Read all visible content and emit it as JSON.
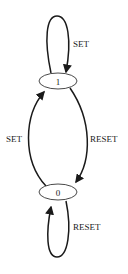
{
  "diagram": {
    "type": "state-diagram",
    "nodes": [
      {
        "id": "1",
        "label": "1"
      },
      {
        "id": "0",
        "label": "0"
      }
    ],
    "edges": [
      {
        "from": "1",
        "to": "1",
        "label": "SET"
      },
      {
        "from": "1",
        "to": "0",
        "label": "RESET"
      },
      {
        "from": "0",
        "to": "1",
        "label": "SET"
      },
      {
        "from": "0",
        "to": "0",
        "label": "RESET"
      }
    ]
  }
}
